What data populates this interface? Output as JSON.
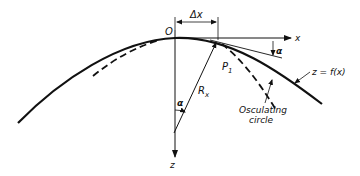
{
  "diagram": {
    "labels": {
      "origin": "O",
      "delta_x": "Δx",
      "x_axis": "x",
      "z_axis": "z",
      "point": "P",
      "point_subscript": "1",
      "radius": "R",
      "radius_subscript": "x",
      "angle_center": "α",
      "angle_tangent": "α",
      "curve": "z = f(x)",
      "osculating_line1": "Osculating",
      "osculating_line2": "circle"
    },
    "colors": {
      "ink": "#111111",
      "background": "#ffffff"
    }
  }
}
